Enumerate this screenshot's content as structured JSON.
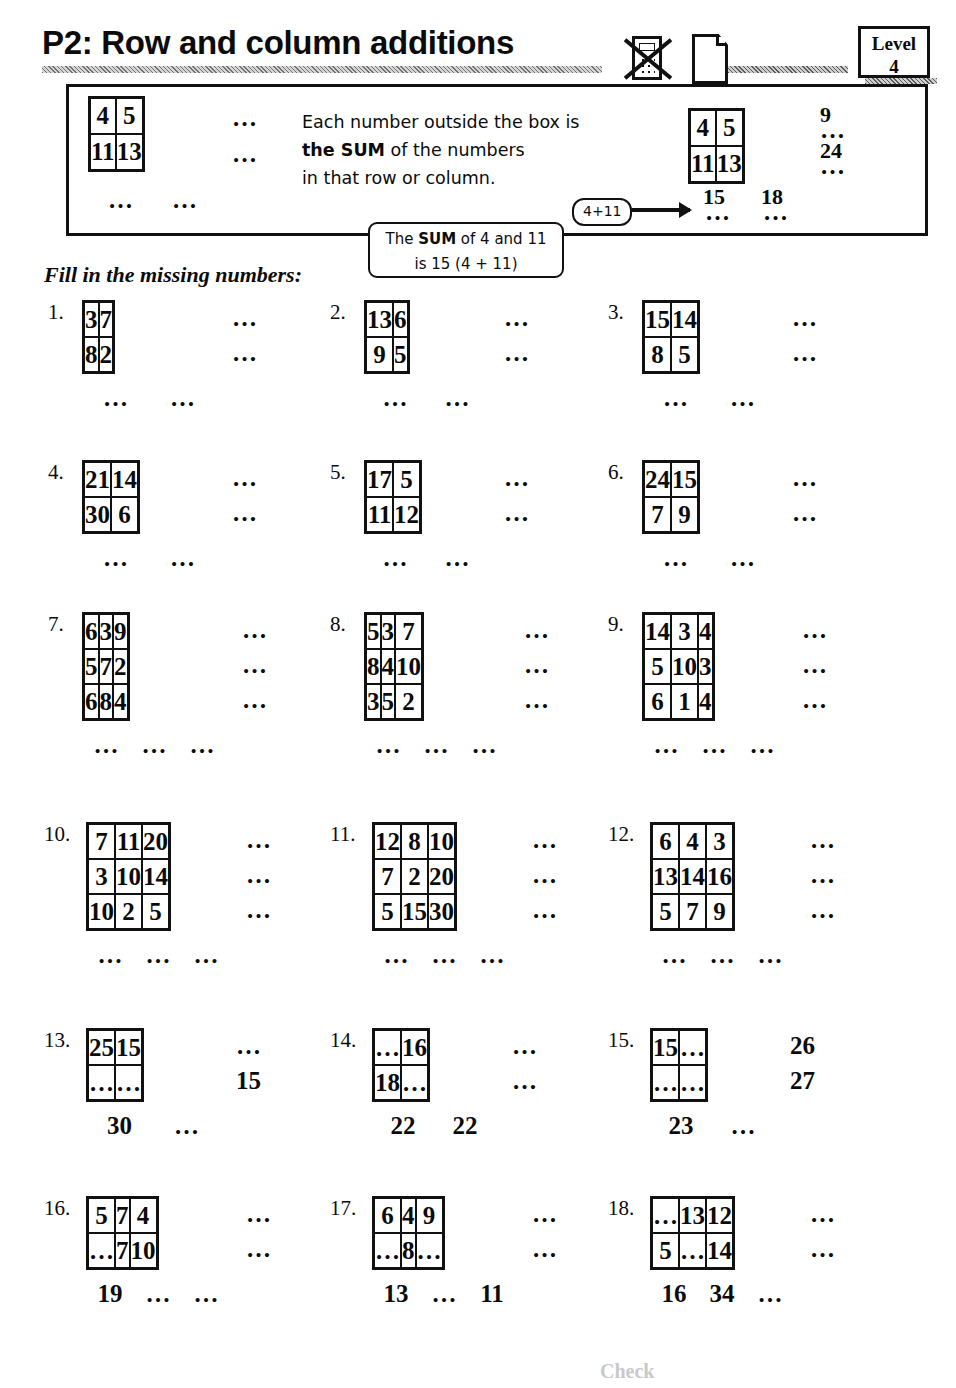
{
  "header": {
    "title": "P2: Row and column additions",
    "level_label": "Level",
    "level_value": "4",
    "calculator_icon": "calculator-crossed-out-icon",
    "paper_icon": "paper-sheet-icon"
  },
  "intro": {
    "text_line1": "Each number outside the box is",
    "text_line2_bold": "the SUM",
    "text_line2_rest": " of the numbers",
    "text_line3": "in that row or column.",
    "callout_expression": "4+11",
    "callout_sum_line1_pre": "The ",
    "callout_sum_line1_bold": "SUM",
    "callout_sum_line1_post": " of 4 and 11",
    "callout_sum_line2": "is 15 (4 + 11)",
    "fill_instruction": "Fill in the missing numbers:",
    "example_left": {
      "cells": [
        [
          "4",
          "5"
        ],
        [
          "11",
          "13"
        ]
      ],
      "row_sums": [
        "…",
        "…"
      ],
      "col_sums": [
        "…",
        "…"
      ]
    },
    "example_right": {
      "cells": [
        [
          "4",
          "5"
        ],
        [
          "11",
          "13"
        ]
      ],
      "row_sums_dots": [
        "…",
        "…"
      ],
      "row_sums_answers": [
        "9",
        "24"
      ],
      "col_sums_dots": [
        "…",
        "…"
      ],
      "col_sums_answers": [
        "15",
        "18"
      ]
    }
  },
  "dots": "…",
  "footer_note": "Check",
  "exercises": [
    {
      "number": "1.",
      "cols": 2,
      "cells": [
        [
          "3",
          "7"
        ],
        [
          "8",
          "2"
        ]
      ],
      "row_sums": [
        "…",
        "…"
      ],
      "col_sums": [
        "…",
        "…"
      ]
    },
    {
      "number": "2.",
      "cols": 2,
      "cells": [
        [
          "13",
          "6"
        ],
        [
          "9",
          "5"
        ]
      ],
      "row_sums": [
        "…",
        "…"
      ],
      "col_sums": [
        "…",
        "…"
      ]
    },
    {
      "number": "3.",
      "cols": 2,
      "cells": [
        [
          "15",
          "14"
        ],
        [
          "8",
          "5"
        ]
      ],
      "row_sums": [
        "…",
        "…"
      ],
      "col_sums": [
        "…",
        "…"
      ]
    },
    {
      "number": "4.",
      "cols": 2,
      "cells": [
        [
          "21",
          "14"
        ],
        [
          "30",
          "6"
        ]
      ],
      "row_sums": [
        "…",
        "…"
      ],
      "col_sums": [
        "…",
        "…"
      ]
    },
    {
      "number": "5.",
      "cols": 2,
      "cells": [
        [
          "17",
          "5"
        ],
        [
          "11",
          "12"
        ]
      ],
      "row_sums": [
        "…",
        "…"
      ],
      "col_sums": [
        "…",
        "…"
      ]
    },
    {
      "number": "6.",
      "cols": 2,
      "cells": [
        [
          "24",
          "15"
        ],
        [
          "7",
          "9"
        ]
      ],
      "row_sums": [
        "…",
        "…"
      ],
      "col_sums": [
        "…",
        "…"
      ]
    },
    {
      "number": "7.",
      "cols": 3,
      "cells": [
        [
          "6",
          "3",
          "9"
        ],
        [
          "5",
          "7",
          "2"
        ],
        [
          "6",
          "8",
          "4"
        ]
      ],
      "row_sums": [
        "…",
        "…",
        "…"
      ],
      "col_sums": [
        "…",
        "…",
        "…"
      ]
    },
    {
      "number": "8.",
      "cols": 3,
      "cells": [
        [
          "5",
          "3",
          "7"
        ],
        [
          "8",
          "4",
          "10"
        ],
        [
          "3",
          "5",
          "2"
        ]
      ],
      "row_sums": [
        "…",
        "…",
        "…"
      ],
      "col_sums": [
        "…",
        "…",
        "…"
      ]
    },
    {
      "number": "9.",
      "cols": 3,
      "cells": [
        [
          "14",
          "3",
          "4"
        ],
        [
          "5",
          "10",
          "3"
        ],
        [
          "6",
          "1",
          "4"
        ]
      ],
      "row_sums": [
        "…",
        "…",
        "…"
      ],
      "col_sums": [
        "…",
        "…",
        "…"
      ]
    },
    {
      "number": "10.",
      "cols": 3,
      "cells": [
        [
          "7",
          "11",
          "20"
        ],
        [
          "3",
          "10",
          "14"
        ],
        [
          "10",
          "2",
          "5"
        ]
      ],
      "row_sums": [
        "…",
        "…",
        "…"
      ],
      "col_sums": [
        "…",
        "…",
        "…"
      ]
    },
    {
      "number": "11.",
      "cols": 3,
      "cells": [
        [
          "12",
          "8",
          "10"
        ],
        [
          "7",
          "2",
          "20"
        ],
        [
          "5",
          "15",
          "30"
        ]
      ],
      "row_sums": [
        "…",
        "…",
        "…"
      ],
      "col_sums": [
        "…",
        "…",
        "…"
      ]
    },
    {
      "number": "12.",
      "cols": 3,
      "cells": [
        [
          "6",
          "4",
          "3"
        ],
        [
          "13",
          "14",
          "16"
        ],
        [
          "5",
          "7",
          "9"
        ]
      ],
      "row_sums": [
        "…",
        "…",
        "…"
      ],
      "col_sums": [
        "…",
        "…",
        "…"
      ]
    },
    {
      "number": "13.",
      "cols": 2,
      "cells": [
        [
          "25",
          "15"
        ],
        [
          "…",
          "…"
        ]
      ],
      "row_sums": [
        "…",
        "15"
      ],
      "col_sums": [
        "30",
        "…"
      ]
    },
    {
      "number": "14.",
      "cols": 2,
      "cells": [
        [
          "…",
          "16"
        ],
        [
          "18",
          "…"
        ]
      ],
      "row_sums": [
        "…",
        "…"
      ],
      "col_sums": [
        "22",
        "22"
      ]
    },
    {
      "number": "15.",
      "cols": 2,
      "cells": [
        [
          "15",
          "…"
        ],
        [
          "…",
          "…"
        ]
      ],
      "row_sums": [
        "26",
        "27"
      ],
      "col_sums": [
        "23",
        "…"
      ]
    },
    {
      "number": "16.",
      "cols": 3,
      "cells": [
        [
          "5",
          "7",
          "4"
        ],
        [
          "…",
          "7",
          "10"
        ]
      ],
      "row_sums": [
        "…",
        "…"
      ],
      "col_sums": [
        "19",
        "…",
        "…"
      ]
    },
    {
      "number": "17.",
      "cols": 3,
      "cells": [
        [
          "6",
          "4",
          "9"
        ],
        [
          "…",
          "8",
          "…"
        ]
      ],
      "row_sums": [
        "…",
        "…"
      ],
      "col_sums": [
        "13",
        "…",
        "11"
      ]
    },
    {
      "number": "18.",
      "cols": 3,
      "cells": [
        [
          "…",
          "13",
          "12"
        ],
        [
          "5",
          "…",
          "14"
        ]
      ],
      "row_sums": [
        "…",
        "…"
      ],
      "col_sums": [
        "16",
        "34",
        "…"
      ]
    }
  ],
  "layout": {
    "positions": [
      {
        "x": 48,
        "y": 300,
        "cellw": 67,
        "cellh": 33
      },
      {
        "x": 330,
        "y": 300,
        "cellw": 62,
        "cellh": 33
      },
      {
        "x": 608,
        "y": 300,
        "cellw": 67,
        "cellh": 33
      },
      {
        "x": 48,
        "y": 460,
        "cellw": 67,
        "cellh": 33
      },
      {
        "x": 330,
        "y": 460,
        "cellw": 62,
        "cellh": 33
      },
      {
        "x": 608,
        "y": 460,
        "cellw": 67,
        "cellh": 33
      },
      {
        "x": 48,
        "y": 612,
        "cellw": 48,
        "cellh": 33
      },
      {
        "x": 330,
        "y": 612,
        "cellw": 48,
        "cellh": 33
      },
      {
        "x": 608,
        "y": 612,
        "cellw": 48,
        "cellh": 33
      },
      {
        "x": 44,
        "y": 822,
        "cellw": 48,
        "cellh": 33
      },
      {
        "x": 330,
        "y": 822,
        "cellw": 48,
        "cellh": 33
      },
      {
        "x": 608,
        "y": 822,
        "cellw": 48,
        "cellh": 33
      },
      {
        "x": 44,
        "y": 1028,
        "cellw": 67,
        "cellh": 33
      },
      {
        "x": 330,
        "y": 1028,
        "cellw": 62,
        "cellh": 33
      },
      {
        "x": 608,
        "y": 1028,
        "cellw": 62,
        "cellh": 33
      },
      {
        "x": 44,
        "y": 1196,
        "cellw": 48,
        "cellh": 33
      },
      {
        "x": 330,
        "y": 1196,
        "cellw": 48,
        "cellh": 33
      },
      {
        "x": 608,
        "y": 1196,
        "cellw": 48,
        "cellh": 33
      }
    ]
  }
}
